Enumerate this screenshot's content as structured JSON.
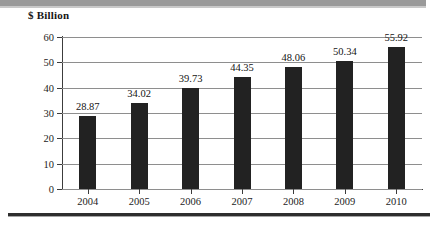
{
  "figure": {
    "axis_title": "$ Billion",
    "bar_color": "#222222",
    "gridline_color": "#8e8e8e",
    "axis_color": "#3c3c3c",
    "background": "#ffffff",
    "top_band_color": "#9a9a9a",
    "bottom_rule_color": "#2e2e2e"
  },
  "chart_data": {
    "type": "bar",
    "title": "",
    "subtitle": "",
    "xlabel": "",
    "ylabel": "$ Billion",
    "categories": [
      "2004",
      "2005",
      "2006",
      "2007",
      "2008",
      "2009",
      "2010"
    ],
    "values": [
      28.87,
      34.02,
      39.73,
      44.35,
      48.06,
      50.34,
      55.92
    ],
    "value_labels": [
      "28.87",
      "34.02",
      "39.73",
      "44.35",
      "48.06",
      "50.34",
      "55.92"
    ],
    "ylim": [
      0,
      60
    ],
    "yticks": [
      0,
      10,
      20,
      30,
      40,
      50,
      60
    ],
    "ytick_labels": [
      "0",
      "10",
      "20",
      "30",
      "40",
      "50",
      "60"
    ],
    "grid": true,
    "legend": false,
    "legend_position": "none",
    "series": [
      {
        "name": "$ Billion",
        "values": [
          28.87,
          34.02,
          39.73,
          44.35,
          48.06,
          50.34,
          55.92
        ]
      }
    ]
  }
}
